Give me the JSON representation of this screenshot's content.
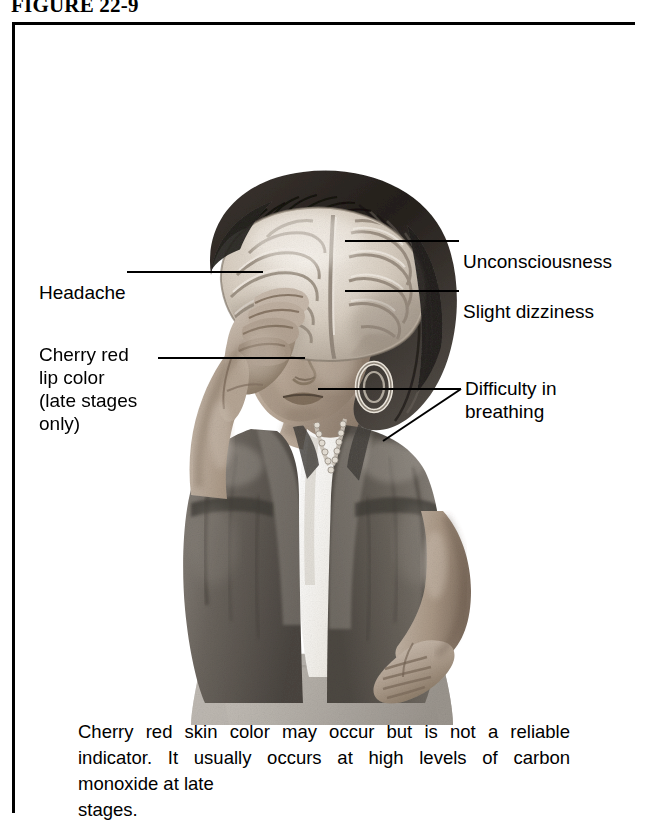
{
  "figure": {
    "number_label": "FIGURE 22-9"
  },
  "title": {
    "line1": "SIGNS AND SYMPTOMS OF",
    "line2": "CARBON MONOXIDE POISONING"
  },
  "intro": {
    "line1": "Greatest effects are on the",
    "line2": "brain, heart, and fetus."
  },
  "callouts": {
    "headache": "Headache",
    "cherry_red_lip": "Cherry red\nlip color\n(late stages\nonly)",
    "unconsciousness": "Unconsciousness",
    "slight_dizziness": "Slight dizziness",
    "difficulty_breathing": "Difficulty in\nbreathing"
  },
  "caption": {
    "body": "Cherry red skin color may occur but is not a reliable indicator. It usually occurs at high levels of carbon monoxide at late",
    "last_line": "stages."
  },
  "illustration": {
    "description": "Grayscale medical illustration of a woman in a dark jacket with one hand on her forehead and one hand on her hip, with a cutaway view of the brain visible inside her head",
    "alt": "woman-with-exposed-brain-illustration"
  },
  "colors": {
    "border": "#000000",
    "text": "#000000",
    "background": "#ffffff",
    "leader_line": "#000000",
    "skin_light": "#d8cfc6",
    "skin_mid": "#b3a598",
    "skin_dark": "#8a7a6c",
    "hair_dark": "#2b2724",
    "jacket_dark": "#5f5a55",
    "jacket_mid": "#7b7670",
    "brain_light": "#efe9e1",
    "brain_mid": "#cfc5b8",
    "brain_dark": "#9c9084",
    "blouse": "#f4f2ee"
  }
}
